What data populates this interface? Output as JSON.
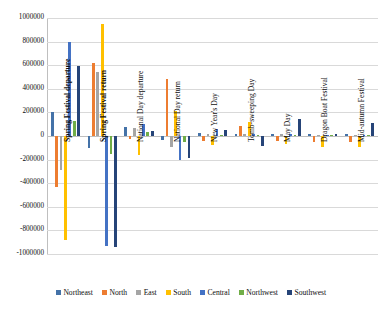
{
  "chart_data": {
    "type": "bar",
    "title": "",
    "xlabel": "",
    "ylabel": "",
    "ylim": [
      -1000000,
      1000000
    ],
    "ytick_step": 200000,
    "grid": true,
    "legend_position": "bottom",
    "ytick_labels": [
      "1000000",
      "800000",
      "600000",
      "400000",
      "200000",
      "0",
      "-200000",
      "-400000",
      "-600000",
      "-800000",
      "-1000000"
    ],
    "ytick_values": [
      1000000,
      800000,
      600000,
      400000,
      200000,
      0,
      -200000,
      -400000,
      -600000,
      -800000,
      -1000000
    ],
    "categories": [
      "Spring Festival departure",
      "Spring Festival return",
      "National Day departure",
      "National Day return",
      "New Year's Day",
      "Tomb-sweeping Day",
      "May Day",
      "Dragon Boat Festival",
      "Mid-autumn Festival"
    ],
    "category_label_bold": [
      true,
      true,
      false,
      false,
      false,
      false,
      false,
      false,
      false
    ],
    "series": [
      {
        "name": "Northeast",
        "color": "#4472a8",
        "values": [
          200000,
          -100000,
          75000,
          -30000,
          25000,
          20000,
          20000,
          15000,
          15000
        ]
      },
      {
        "name": "North",
        "color": "#ed7d31",
        "values": [
          -430000,
          615000,
          -25000,
          480000,
          -45000,
          85000,
          -40000,
          -55000,
          -50000
        ]
      },
      {
        "name": "East",
        "color": "#a5a5a5",
        "values": [
          -285000,
          545000,
          70000,
          -90000,
          20000,
          15000,
          15000,
          10000,
          10000
        ]
      },
      {
        "name": "South",
        "color": "#ffc000",
        "values": [
          -880000,
          950000,
          -160000,
          215000,
          -75000,
          115000,
          -70000,
          -95000,
          -90000
        ]
      },
      {
        "name": "Central",
        "color": "#4472c4",
        "values": [
          795000,
          -930000,
          105000,
          -205000,
          60000,
          20000,
          15000,
          10000,
          10000
        ]
      },
      {
        "name": "Northwest",
        "color": "#70ad47",
        "values": [
          130000,
          -150000,
          30000,
          -55000,
          10000,
          10000,
          5000,
          5000,
          5000
        ]
      },
      {
        "name": "Southwest",
        "color": "#264478",
        "values": [
          595000,
          -940000,
          45000,
          -185000,
          55000,
          -85000,
          140000,
          20000,
          110000
        ]
      }
    ]
  }
}
